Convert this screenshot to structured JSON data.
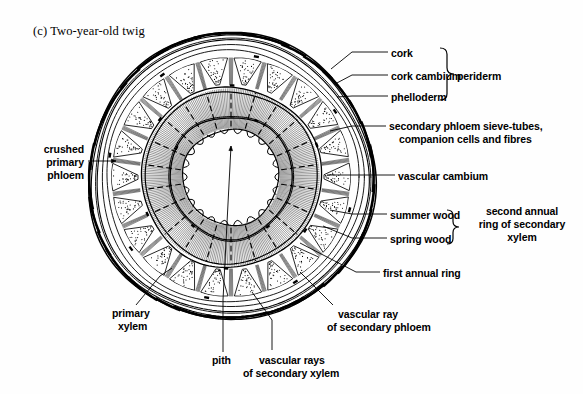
{
  "figure": {
    "caption": "(c) Two-year-old twig",
    "background_color": "#fefefe",
    "ink_color": "#000000"
  },
  "labels": {
    "cork": "cork",
    "cork_cambium": "cork cambium",
    "phelloderm": "phelloderm",
    "periderm": "periderm",
    "secondary_phloem_l1": "secondary phloem sieve-tubes,",
    "secondary_phloem_l2": "companion cells and fibres",
    "vascular_cambium": "vascular cambium",
    "summer_wood": "summer wood",
    "spring_wood": "spring wood",
    "second_ring_l1": "second annual",
    "second_ring_l2": "ring of secondary",
    "second_ring_l3": "xylem",
    "first_annual_ring": "first annual ring",
    "crushed_l1": "crushed",
    "crushed_l2": "primary",
    "crushed_l3": "phloem",
    "primary_xylem_l1": "primary",
    "primary_xylem_l2": "xylem",
    "pith": "pith",
    "vascular_rays_xylem_l1": "vascular rays",
    "vascular_rays_xylem_l2": "of secondary xylem",
    "vascular_ray_phloem_l1": "vascular ray",
    "vascular_ray_phloem_l2": "of secondary phloem"
  },
  "structure": {
    "center_x": 231,
    "center_y": 177,
    "rings": [
      {
        "name": "cork",
        "radius": 141
      },
      {
        "name": "cork-cambium",
        "radius": 136
      },
      {
        "name": "phelloderm",
        "radius": 131
      },
      {
        "name": "cortex-outer",
        "radius": 126
      },
      {
        "name": "secondary-phloem-outer",
        "radius": 120
      },
      {
        "name": "vascular-cambium",
        "radius": 90
      },
      {
        "name": "second-annual-ring-boundary",
        "radius": 86
      },
      {
        "name": "first-annual-ring-boundary",
        "radius": 61
      },
      {
        "name": "primary-xylem-inner",
        "radius": 48
      },
      {
        "name": "pith-boundary",
        "radius": 43
      }
    ],
    "phloem_wedge_count": 22,
    "xylem_ray_count": 22,
    "primary_xylem_lobe_count": 22
  }
}
